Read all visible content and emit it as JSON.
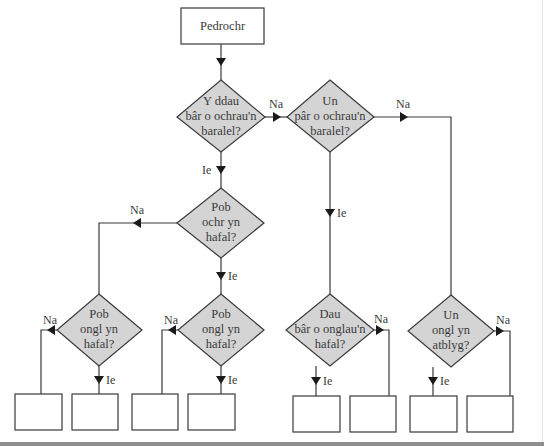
{
  "diagram": {
    "start": {
      "label": "Pedrochr"
    },
    "decisions": [
      {
        "id": "d1",
        "lines": [
          "Y ddau",
          "bâr o ochrau'n",
          "baralel?"
        ]
      },
      {
        "id": "d2",
        "lines": [
          "Un",
          "pâr o ochrau'n",
          "baralel?"
        ]
      },
      {
        "id": "d3",
        "lines": [
          "Pob",
          "ochr yn",
          "hafal?"
        ]
      },
      {
        "id": "d4",
        "lines": [
          "Pob",
          "ongl yn",
          "hafal?"
        ]
      },
      {
        "id": "d5",
        "lines": [
          "Pob",
          "ongl yn",
          "hafal?"
        ]
      },
      {
        "id": "d6",
        "lines": [
          "Dau",
          "bâr o onglau'n",
          "hafal?"
        ]
      },
      {
        "id": "d7",
        "lines": [
          "Un",
          "ongl yn",
          "atblyg?"
        ]
      }
    ],
    "edge_labels": {
      "yes": "Ie",
      "no": "Na"
    },
    "answer_boxes": [
      "",
      "",
      "",
      "",
      "",
      "",
      "",
      ""
    ],
    "colors": {
      "decision_fill": "#d4d4d4",
      "stroke": "#3a3a3a",
      "background": "#ffffff"
    }
  }
}
